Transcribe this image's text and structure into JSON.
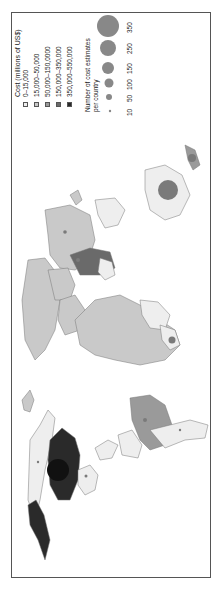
{
  "legend": {
    "cost_title": "Cost (millions of US$)",
    "cost_classes": [
      {
        "label": "0–15,000",
        "color": "#eeeeee"
      },
      {
        "label": "15,000–50,000",
        "color": "#c9c9c9"
      },
      {
        "label": "50,000–150,0000",
        "color": "#9a9a9a"
      },
      {
        "label": "150,000–350,000",
        "color": "#6a6a6a"
      },
      {
        "label": "350,000–550,000",
        "color": "#2a2a2a"
      }
    ],
    "bubble_title_line1": "Number of cost estimates",
    "bubble_title_line2": "per country",
    "bubble_sizes": [
      {
        "label": "10",
        "value": 10
      },
      {
        "label": "50",
        "value": 50
      },
      {
        "label": "100",
        "value": 100
      },
      {
        "label": "150",
        "value": 150
      },
      {
        "label": "250",
        "value": 250
      },
      {
        "label": "350",
        "value": 350
      }
    ],
    "bubble_color": "#8a8a8a"
  },
  "map": {
    "orientation": "rotated 90° counter-clockwise",
    "ocean_color": "#ffffff",
    "border_color": "#666666"
  }
}
